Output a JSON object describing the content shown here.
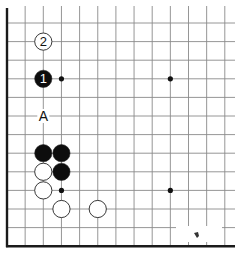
{
  "diagram": {
    "type": "go-board-fragment",
    "columns": 13,
    "rows": 13,
    "edges": [
      "left",
      "bottom"
    ],
    "line_color": "#8a8a8a",
    "edge_color": "#1a1a1a",
    "hoshi": [
      {
        "col": 3,
        "row": 3
      },
      {
        "col": 9,
        "row": 3
      },
      {
        "col": 3,
        "row": 9
      },
      {
        "col": 9,
        "row": 9
      }
    ],
    "stones": [
      {
        "color": "white",
        "col": 2,
        "row": 1,
        "label": "2"
      },
      {
        "color": "black",
        "col": 2,
        "row": 3,
        "label": "1"
      },
      {
        "color": "black",
        "col": 2,
        "row": 7,
        "label": ""
      },
      {
        "color": "black",
        "col": 3,
        "row": 7,
        "label": ""
      },
      {
        "color": "black",
        "col": 3,
        "row": 8,
        "label": ""
      },
      {
        "color": "white",
        "col": 2,
        "row": 8,
        "label": ""
      },
      {
        "color": "white",
        "col": 2,
        "row": 9,
        "label": ""
      },
      {
        "color": "white",
        "col": 3,
        "row": 10,
        "label": ""
      },
      {
        "color": "white",
        "col": 5,
        "row": 10,
        "label": ""
      }
    ],
    "markers": [
      {
        "col": 2,
        "row": 5,
        "label": "A"
      }
    ]
  }
}
